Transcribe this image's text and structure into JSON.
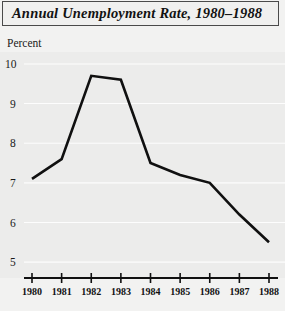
{
  "title": {
    "text": "Annual Unemployment Rate, 1980–1988"
  },
  "axis": {
    "y_label": "Percent"
  },
  "chart_data": {
    "type": "line",
    "title": "Annual Unemployment Rate, 1980–1988",
    "xlabel": "",
    "ylabel": "Percent",
    "categories": [
      "1980",
      "1981",
      "1982",
      "1983",
      "1984",
      "1985",
      "1986",
      "1987",
      "1988"
    ],
    "x": [
      1980,
      1981,
      1982,
      1983,
      1984,
      1985,
      1986,
      1987,
      1988
    ],
    "values": [
      7.1,
      7.6,
      9.7,
      9.6,
      7.5,
      7.2,
      7.0,
      6.2,
      5.5
    ],
    "ylim": [
      4.6,
      10.2
    ],
    "yticks": [
      10,
      9,
      8,
      7,
      6,
      5
    ],
    "ytick_labels": [
      "10",
      "9",
      "8",
      "7",
      "6",
      "5"
    ],
    "xtick_labels": [
      "1980",
      "1981",
      "1982",
      "1983",
      "1984",
      "1985",
      "1986",
      "1987",
      "1988"
    ],
    "grid": true,
    "legend": "none",
    "series": [
      {
        "name": "Unemployment Rate",
        "values": [
          7.1,
          7.6,
          9.7,
          9.6,
          7.5,
          7.2,
          7.0,
          6.2,
          5.5
        ]
      }
    ],
    "colors": {
      "line": "#101010",
      "plot_background": "#ececeb",
      "gridline": "#fdfdfd",
      "page_background": "#f2f2f1",
      "title_border": "#4a4a4a"
    }
  }
}
